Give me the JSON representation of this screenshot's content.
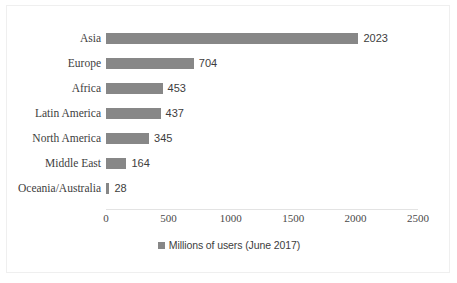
{
  "chart_data": {
    "type": "bar",
    "orientation": "horizontal",
    "title": "",
    "xlabel": "",
    "ylabel": "",
    "xlim": [
      0,
      2500
    ],
    "xticks": [
      0,
      500,
      1000,
      1500,
      2000,
      2500
    ],
    "xtick_labels": [
      "0",
      "500",
      "1000",
      "1500",
      "2000",
      "2500"
    ],
    "grid": false,
    "legend_position": "bottom",
    "bar_color": "#878787",
    "categories": [
      "Asia",
      "Europe",
      "Africa",
      "Latin America",
      "North America",
      "Middle East",
      "Oceania/Australia"
    ],
    "values": [
      2023,
      704,
      453,
      437,
      345,
      164,
      28
    ],
    "data_labels": [
      "2023",
      "704",
      "453",
      "437",
      "345",
      "164",
      "28"
    ],
    "series": [
      {
        "name": "Millions of users (June 2017)",
        "values": [
          2023,
          704,
          453,
          437,
          345,
          164,
          28
        ]
      }
    ],
    "legend": [
      {
        "label": "Millions of users (June 2017)",
        "color": "#878787"
      }
    ]
  }
}
